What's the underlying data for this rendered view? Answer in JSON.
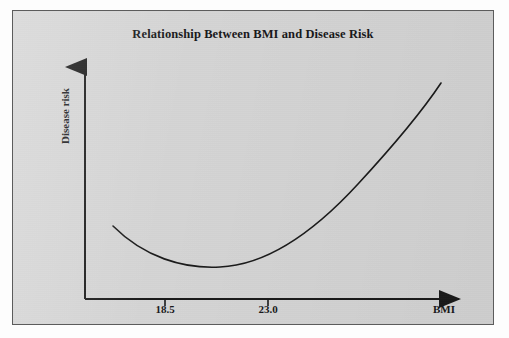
{
  "figure": {
    "background_color": "#d4d4d4",
    "border_color": "#5c5c5c",
    "ink_color": "#1a1a1a"
  },
  "chart_data": {
    "type": "line",
    "title": "Relationship Between BMI and Disease Risk",
    "xlabel": "BMI",
    "ylabel": "Disease risk",
    "grid": false,
    "legend": null,
    "axis_style": "arrow-ended open axes (L-shaped), no numeric y-axis scale",
    "xticks": [
      "18.5",
      "23.0"
    ],
    "yticks": [],
    "annotations": [],
    "x": [
      17.3,
      18.0,
      18.5,
      19.2,
      20.0,
      20.7,
      21.5,
      22.2,
      23.0,
      24.0,
      25.2,
      26.5,
      27.8,
      29.0,
      30.2,
      31.4
    ],
    "y": [
      0.62,
      0.45,
      0.33,
      0.25,
      0.2,
      0.19,
      0.22,
      0.28,
      0.37,
      0.5,
      0.67,
      0.86,
      1.06,
      1.28,
      1.52,
      1.77
    ],
    "minimum_point": {
      "x": 20.3,
      "y": 0.19
    },
    "series": [
      {
        "name": "Disease risk",
        "values": [
          0.62,
          0.45,
          0.33,
          0.25,
          0.2,
          0.19,
          0.22,
          0.28,
          0.37,
          0.5,
          0.67,
          0.86,
          1.06,
          1.28,
          1.52,
          1.77
        ]
      }
    ]
  },
  "plot_geometry": {
    "origin_x": 72,
    "origin_y": 288,
    "y_axis_top": 48,
    "x_axis_right": 455,
    "tick_positions_px": [
      152,
      255
    ],
    "tick_label_y": 292,
    "curve_path": "M 100,215 C 131,246 170,258 207,256 C 253,254 300,222 345,173 C 381,134 410,99 428,72",
    "curve_width": 1.6
  }
}
